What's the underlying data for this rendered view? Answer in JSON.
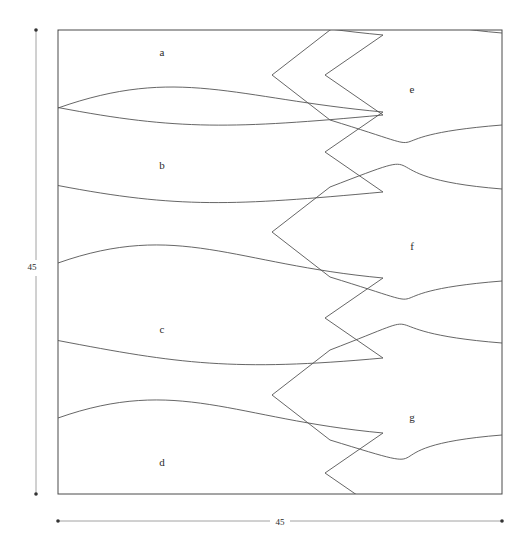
{
  "figure": {
    "type": "tessellation-diagram",
    "background_color": "#ffffff",
    "line_color": "#555555",
    "frame_color": "#4a4a4a",
    "dimension_color": "#8a8a8a",
    "square": {
      "x": 58,
      "y": 30,
      "width": 444,
      "height": 464
    },
    "tiles": [
      {
        "id": "a",
        "label": "a",
        "label_x": 162,
        "label_y": 53,
        "column": "left",
        "nose_y": 30,
        "tail_y": 75,
        "tail_x": 325
      },
      {
        "id": "b",
        "label": "b",
        "label_x": 162,
        "label_y": 166,
        "column": "left",
        "nose_y": 108,
        "tail_y": 152,
        "tail_x": 325
      },
      {
        "id": "c",
        "label": "c",
        "label_x": 162,
        "label_y": 330,
        "column": "left",
        "nose_y": 263,
        "tail_y": 318,
        "tail_x": 325
      },
      {
        "id": "d",
        "label": "d",
        "label_x": 162,
        "label_y": 463,
        "column": "left",
        "nose_y": 418,
        "tail_y": 473,
        "tail_x": 325
      },
      {
        "id": "e",
        "label": "e",
        "label_x": 412,
        "label_y": 90,
        "column": "right",
        "nose_y": 30,
        "tail_y": 75,
        "tail_x": 272
      },
      {
        "id": "f",
        "label": "f",
        "label_x": 412,
        "label_y": 247,
        "column": "right",
        "nose_y": 186,
        "tail_y": 232,
        "tail_x": 272
      },
      {
        "id": "g",
        "label": "g",
        "label_x": 412,
        "label_y": 418,
        "column": "right",
        "nose_y": 340,
        "tail_y": 395,
        "tail_x": 272
      }
    ],
    "dimensions": {
      "vertical": {
        "label": "45",
        "label_x": 32,
        "label_y": 268,
        "line_x": 36,
        "y_start": 30,
        "y_end": 494
      },
      "horizontal": {
        "label": "45",
        "label_x": 280,
        "label_y": 523,
        "line_y": 521,
        "x_start": 58,
        "x_end": 502
      }
    }
  }
}
